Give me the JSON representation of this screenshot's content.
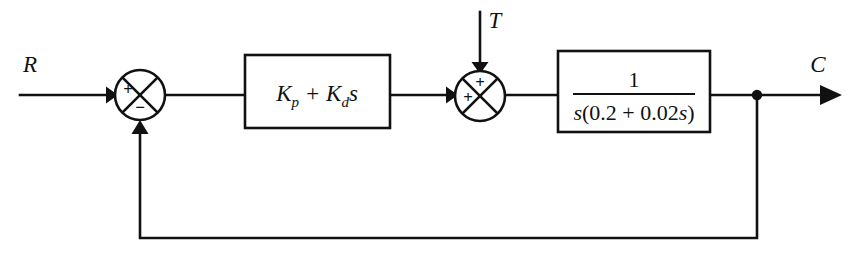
{
  "diagram": {
    "background_color": "#ffffff",
    "line_color": "#111111",
    "signals": {
      "reference_label": "R",
      "disturbance_label": "T",
      "output_label": "C"
    },
    "blocks": [
      {
        "name": "controller",
        "kind": "rectangle",
        "expression": "K_p + K_d s",
        "parts": {
          "k": "K",
          "sub_p": "p",
          "plus": "+",
          "k2": "K",
          "sub_d": "d",
          "s": "s"
        }
      },
      {
        "name": "plant",
        "kind": "rectangle",
        "expression": "1 / (s(0.2 + 0.02s))",
        "numerator": "1",
        "denominator_parts": {
          "s_lead": "s",
          "open_paren": "(",
          "coef_a": "0.2",
          "plus": "+",
          "coef_b": "0.02",
          "s_trail": "s",
          "close_paren": ")"
        }
      }
    ],
    "summing_junctions": [
      {
        "name": "error-summing-junction",
        "signs": {
          "left_input": "+",
          "bottom_input": "−"
        }
      },
      {
        "name": "disturbance-summing-junction",
        "signs": {
          "left_input": "+",
          "top_input": "+"
        }
      }
    ],
    "feedback": {
      "name": "unity-feedback-path",
      "takeoff_node": "output-takeoff-node"
    }
  }
}
